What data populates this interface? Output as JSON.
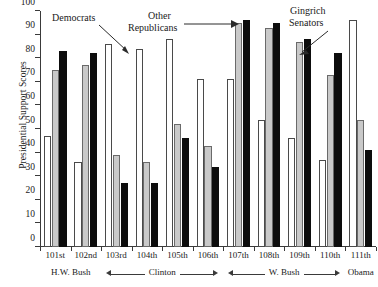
{
  "chart_data": {
    "type": "bar",
    "title": "",
    "xlabel": "",
    "ylabel": "Presidential Support Scores",
    "ylim": [
      0,
      100
    ],
    "ytick_labels": [
      "0",
      "10",
      "20",
      "30",
      "40",
      "50",
      "60",
      "70",
      "80",
      "90",
      "100"
    ],
    "ytick_values": [
      0,
      10,
      20,
      30,
      40,
      50,
      60,
      70,
      80,
      90,
      100
    ],
    "grid": false,
    "legend_position": "none",
    "categories": [
      "101st",
      "102nd",
      "103rd",
      "104th",
      "105th",
      "106th",
      "107th",
      "108th",
      "109th",
      "110th",
      "111th"
    ],
    "series": [
      {
        "name": "Democrats",
        "fill": "white",
        "color": "#ffffff",
        "values": [
          47,
          36,
          86,
          84,
          88,
          71,
          71,
          54,
          46,
          37,
          96
        ]
      },
      {
        "name": "Other Republicans",
        "fill": "gray",
        "color": "#c9c9c9",
        "values": [
          75,
          77,
          39,
          36,
          52,
          43,
          95,
          93,
          87,
          73,
          54
        ]
      },
      {
        "name": "Gingrich Senators",
        "fill": "black",
        "color": "#0d0d0d",
        "values": [
          83,
          82,
          27,
          27,
          46,
          34,
          96,
          95,
          88,
          82,
          41
        ]
      }
    ],
    "annotations": [
      {
        "text": "Democrats",
        "points_to": "101st-103rd white bar"
      },
      {
        "text": "Other\nRepublicans",
        "points_to": "107th gray bar"
      },
      {
        "text": "Gingrich\nSenators",
        "points_to": "109th black bar"
      }
    ],
    "president_groups": [
      {
        "label": "H.W. Bush",
        "congresses": [
          "101st",
          "102nd"
        ],
        "arrows": "none"
      },
      {
        "label": "Clinton",
        "congresses": [
          "103rd",
          "104th",
          "105th",
          "106th"
        ],
        "arrows": "both"
      },
      {
        "label": "W. Bush",
        "congresses": [
          "107th",
          "108th",
          "109th",
          "110th"
        ],
        "arrows": "both"
      },
      {
        "label": "Obama",
        "congresses": [
          "111th"
        ],
        "arrows": "none"
      }
    ]
  },
  "annotations": {
    "democrats": "Democrats",
    "other_republicans_line1": "Other",
    "other_republicans_line2": "Republicans",
    "gingrich_line1": "Gingrich",
    "gingrich_line2": "Senators"
  },
  "presidents": {
    "hw_bush": "H.W. Bush",
    "clinton": "Clinton",
    "w_bush": "W. Bush",
    "obama": "Obama"
  },
  "colors": {
    "democrats": "#ffffff",
    "other_republicans": "#c9c9c9",
    "gingrich_senators": "#0d0d0d",
    "axis": "#3a3a3a",
    "background": "#ffffff"
  }
}
